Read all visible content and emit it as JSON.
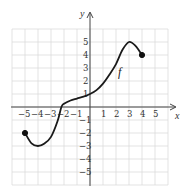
{
  "chart_data": {
    "type": "line",
    "title": "",
    "xlabel": "x",
    "ylabel": "y",
    "function_label": "f",
    "xlim": [
      -6,
      6
    ],
    "ylim": [
      -6,
      6
    ],
    "grid": true,
    "x_ticks": [
      "-5",
      "-4",
      "-3",
      "-2",
      "-1",
      "1",
      "2",
      "3",
      "4",
      "5"
    ],
    "y_ticks": [
      "5",
      "4",
      "3",
      "2",
      "1",
      "-1",
      "-2",
      "-3",
      "-4",
      "-5"
    ],
    "series": [
      {
        "name": "f",
        "x": [
          -5,
          -4.5,
          -4,
          -3.5,
          -3,
          -2.5,
          -2.2,
          -2,
          -1.5,
          -1,
          -0.5,
          0,
          0.5,
          1,
          1.5,
          2,
          2.5,
          3,
          3.5,
          4
        ],
        "y": [
          -2,
          -2.8,
          -3,
          -2.8,
          -2.3,
          -1.1,
          0,
          0.25,
          0.5,
          0.65,
          0.8,
          1,
          1.3,
          1.8,
          2.5,
          3.3,
          4.4,
          5,
          4.7,
          4
        ]
      }
    ],
    "endpoints": [
      {
        "x": -5,
        "y": -2,
        "filled": true
      },
      {
        "x": 4,
        "y": 4,
        "filled": true
      }
    ],
    "key_points": {
      "minimum": {
        "x": -4,
        "y": -3
      },
      "maximum": {
        "x": 3,
        "y": 5
      },
      "y_intercept": {
        "x": 0,
        "y": 1
      }
    }
  },
  "labels": {
    "x_axis": "x",
    "y_axis": "y",
    "curve": "f"
  }
}
